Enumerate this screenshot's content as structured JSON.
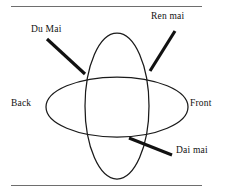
{
  "figure": {
    "background_color": "#ffffff",
    "ink_color": "#111111",
    "rule_color": "#6e6e6e",
    "width": 230,
    "height": 193
  },
  "rules": {
    "top_rule_label": "top-divider",
    "bottom_rule_label": "bottom-divider"
  },
  "shapes": {
    "vertical_ellipse": {
      "name": "vertical-meridian-ellipse",
      "cx": 117,
      "cy": 106,
      "rx": 32,
      "ry": 73
    },
    "horizontal_ellipse": {
      "name": "horizontal-belt-ellipse",
      "cx": 117,
      "cy": 107,
      "rx": 71,
      "ry": 30
    }
  },
  "labels": {
    "du_mai": "Du Mai",
    "ren_mai": "Ren mai",
    "back": "Back",
    "front": "Front",
    "dai_mai": "Dai mai"
  },
  "leaders": [
    {
      "name": "leader-du-mai",
      "x1": 47,
      "y1": 39,
      "x2": 85,
      "y2": 74
    },
    {
      "name": "leader-ren-mai",
      "x1": 175,
      "y1": 31,
      "x2": 150,
      "y2": 71
    },
    {
      "name": "leader-dai-mai",
      "x1": 172,
      "y1": 155,
      "x2": 129,
      "y2": 138
    }
  ]
}
